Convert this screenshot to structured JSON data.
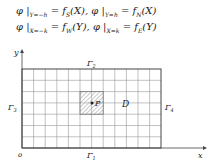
{
  "equations": [
    {
      "lhs1": "φ |",
      "sub1": "Y=−h",
      "rhs1": "= f",
      "fsub1": "S",
      "arg1": "(X),",
      "lhs2": " φ |",
      "sub2": "Y=h",
      "rhs2": "= f",
      "fsub2": "N",
      "arg2": "(X)"
    },
    {
      "lhs1": "φ |",
      "sub1": "X=−k",
      "rhs1": "= f",
      "fsub1": "W",
      "arg1": "(Y),",
      "lhs2": " φ |",
      "sub2": "X=k",
      "rhs2": "= f",
      "fsub2": "E",
      "arg2": "(Y)"
    }
  ],
  "diagram": {
    "axis_x_label": "x",
    "axis_y_label": "y",
    "origin_label": "o",
    "region_label": "D",
    "point_label": "P",
    "boundary_top": "Γ",
    "boundary_top_sub": "2",
    "boundary_bottom": "Γ",
    "boundary_bottom_sub": "1",
    "boundary_left": "Γ",
    "boundary_left_sub": "3",
    "boundary_right": "Γ",
    "boundary_right_sub": "4",
    "grid_columns": 12,
    "grid_rows": 7
  }
}
